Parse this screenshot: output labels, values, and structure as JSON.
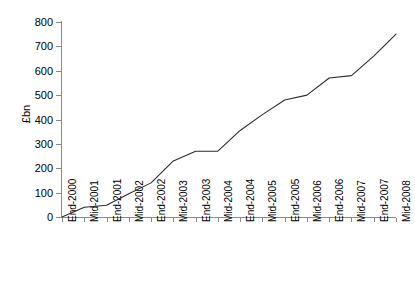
{
  "chart_data": {
    "type": "line",
    "title": "",
    "subtitle": "",
    "xlabel": "",
    "ylabel": "£bn",
    "ylim": [
      0,
      800
    ],
    "yticks": [
      0,
      100,
      200,
      300,
      400,
      500,
      600,
      700,
      800
    ],
    "grid": false,
    "legend": null,
    "categories": [
      "End-2000",
      "Mid-2001",
      "End-2001",
      "Mid-2002",
      "End-2002",
      "Mid-2003",
      "End-2003",
      "Mid-2004",
      "End-2004",
      "Mid-2005",
      "End-2005",
      "Mid-2006",
      "End-2006",
      "Mid-2007",
      "End-2007",
      "Mid-2008"
    ],
    "values": [
      0,
      40,
      48,
      95,
      140,
      230,
      270,
      270,
      355,
      420,
      480,
      500,
      570,
      580,
      660,
      750
    ],
    "series": [
      {
        "name": "",
        "values": [
          0,
          40,
          48,
          95,
          140,
          230,
          270,
          270,
          355,
          420,
          480,
          500,
          570,
          580,
          660,
          750
        ]
      }
    ],
    "colors": {
      "line": "#2b2b2b",
      "axis": "#8a8a8a",
      "text": "#000000",
      "background": "#ffffff"
    }
  }
}
